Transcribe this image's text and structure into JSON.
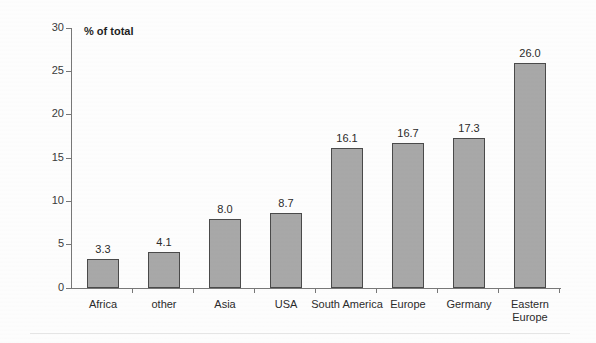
{
  "chart_data": {
    "type": "bar",
    "title": "",
    "subtitle": "",
    "axis_title": "% of total",
    "xlabel": "",
    "ylabel": "% of total",
    "categories": [
      "Africa",
      "other",
      "Asia",
      "USA",
      "South America",
      "Europe",
      "Germany",
      "Eastern Europe"
    ],
    "values": [
      3.3,
      4.1,
      8.0,
      8.7,
      16.1,
      16.7,
      17.3,
      26.0
    ],
    "value_labels": [
      "3.3",
      "4.1",
      "8.0",
      "8.7",
      "16.1",
      "16.7",
      "17.3",
      "26.0"
    ],
    "ylim": [
      0,
      30
    ],
    "ytick_values": [
      0,
      5,
      10,
      15,
      20,
      25,
      30
    ],
    "ytick_labels": [
      "0",
      "5",
      "10",
      "15",
      "20",
      "25",
      "30"
    ],
    "grid": false,
    "legend": false,
    "legend_position": "none",
    "bar_fill_color": "#a8a8a8",
    "bar_border_color": "#4a4a4a",
    "axis_color": "#777777",
    "background_color": "#fdfdfd",
    "text_color": "#2b2b2b"
  }
}
